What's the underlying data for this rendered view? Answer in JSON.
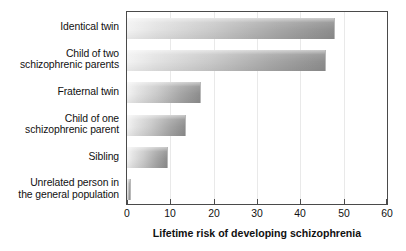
{
  "chart_data": {
    "type": "bar",
    "orientation": "horizontal",
    "title": "",
    "xlabel": "Lifetime risk of developing schizophrenia",
    "ylabel": "",
    "xlim": [
      0,
      60
    ],
    "xticks": [
      0,
      10,
      20,
      30,
      40,
      50,
      60
    ],
    "xtick_labels": [
      "0",
      "10",
      "20",
      "30",
      "40",
      "50",
      "60"
    ],
    "grid": true,
    "grid_axis": "x",
    "legend": null,
    "categories": [
      "Identical twin",
      "Child of two schizophrenic parents",
      "Fraternal twin",
      "Child of one schizophrenic parent",
      "Sibling",
      "Unrelated person in the general population"
    ],
    "category_lines": [
      [
        "Identical twin"
      ],
      [
        "Child of two",
        "schizophrenic parents"
      ],
      [
        "Fraternal twin"
      ],
      [
        "Child of one",
        "schizophrenic parent"
      ],
      [
        "Sibling"
      ],
      [
        "Unrelated person in",
        "the general population"
      ]
    ],
    "values": [
      48,
      46,
      17,
      13.5,
      9.5,
      1
    ],
    "bar_color_start": "#f3f3f3",
    "bar_color_end": "#8e8e8e",
    "frame_color": "#4a4a4a",
    "gridline_color": "#e9e9e9"
  }
}
